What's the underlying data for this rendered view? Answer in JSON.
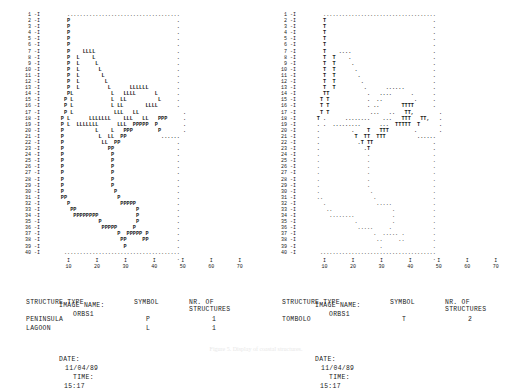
{
  "panels": [
    {
      "id": "left",
      "row_labels_max": 40,
      "row_label_suffix": " -I",
      "meta": {
        "image_name_label": "IMAGE NAME:",
        "image_name_value": "ORBS1",
        "date_label": "DATE:",
        "date_value": "11/04/89",
        "time_label": "TIME:",
        "time_value": "15:17"
      },
      "table": {
        "headers": [
          "STRUCTURE TYPE",
          "SYMBOL",
          "NR. OF STRUCTURES"
        ],
        "rows": [
          {
            "type": "PENINSULA",
            "symbol": "P",
            "count": "1"
          },
          {
            "type": "LAGOON",
            "symbol": "L",
            "count": "1"
          }
        ]
      },
      "grid": [
        "        ....................................",
        "        P                                  .",
        "        P                                  .",
        "        P                                  .",
        "        P                                  .",
        "        P                                  .",
        "        P    LLLL                          .",
        "        P  L    L                          .",
        "        P  L     L                         .",
        "        P  L      L                        .",
        "        P  L       L                       .",
        "        P  L        L                      .",
        "        P  L         L      LLLLLL         .",
        "        PL            L   LLLL      L      .",
        "       P L            L  LL          L     .",
        "       P L            L LL       LLLL      .",
        "       P L             LLL   LL              .",
        "      P L      LLLLLLL    LLL   LL   PPP     .",
        "      P L  LLLLLLL      LLL  PPPPP  P        .",
        "      P          L    L   PPP        P       .",
        "      P           L  LL  PP           ......",
        "      P            LL  PP                  .",
        "      P              PP                    .",
        "      P               P                    .",
        "      P               P                    .",
        "      P               P                    .",
        "      P               P                    .",
        "      P               P                    .",
        "      P               P                    .",
        "      P                P                   .",
        "      PP                P                  .",
        "        P                PPPPP             .",
        "         PP                   P            .",
        "          PPPPPPPP            P            .",
        "                  P           P            .",
        "                   PPPPP     P             .",
        "                        P  PPPPP P         .",
        "                         PP     PP         .",
        "                          P                .",
        "       .....................................",
        "                                           ."
      ]
    },
    {
      "id": "right",
      "row_labels_max": 40,
      "row_label_suffix": " -I",
      "meta": {
        "image_name_label": "IMAGE NAME:",
        "image_name_value": "ORBS1",
        "date_label": "DATE:",
        "date_value": "11/04/89",
        "time_label": "TIME:",
        "time_value": "15:17"
      },
      "table": {
        "headers": [
          "STRUCTURE TYPE",
          "SYMBOL",
          "NR. OF STRUCTURES"
        ],
        "rows": [
          {
            "type": "TOMBOLO",
            "symbol": "T",
            "count": "2"
          }
        ]
      },
      "grid": [
        "        ....................................",
        "        T                                  .",
        "        T                                  .",
        "        T                                  .",
        "        T                                  .",
        "        T                                  .",
        "        T    ....                          .",
        "        T  T    .                          .",
        "        T  T     .                         .",
        "        T  T      .                        .",
        "        T  T       .                       .",
        "        T  T        .                      .",
        "        T  T         .      ......         .",
        "        TT            .   ....      .      .",
        "       T T            .  ..          .     .",
        "       T T            . ..       TTTT      .",
        "       T T             ...   ..   TT,        .",
        "      T .      ........    ...   TTT   TT,   .",
        "      . .  .........      ...  TTTTT  T      .",
        "      .          .    T   TTT        .       .",
        "      .           T  TT  TTT          ......",
        "      .            .T TT                   .",
        "      .              .T                    .",
        "      .               .                    .",
        "      .               .                    .",
        "      .               .                    .",
        "      .               .                    .",
        "      .               .                    .",
        "      .               .                    .",
        "      .                .                   .",
        "      ..                .                  .",
        "        .                .....             .",
        "         ..                   .            .",
        "          ........            .            .",
        "                  .           .            .",
        "                   .....     .             .",
        "                        .  ..... .         .",
        "                         ..     ..         .",
        "                          .                .",
        "       .....................................",
        "                                           ."
      ]
    }
  ],
  "xaxis": {
    "ticks": [
      "10",
      "20",
      "30",
      "40",
      "50",
      "60",
      "70"
    ],
    "tick_mark": "I",
    "positions": [
      13,
      27,
      41,
      55,
      69,
      83,
      97
    ]
  },
  "caption": {
    "text": "Figure 5. Display of coastal structures."
  }
}
